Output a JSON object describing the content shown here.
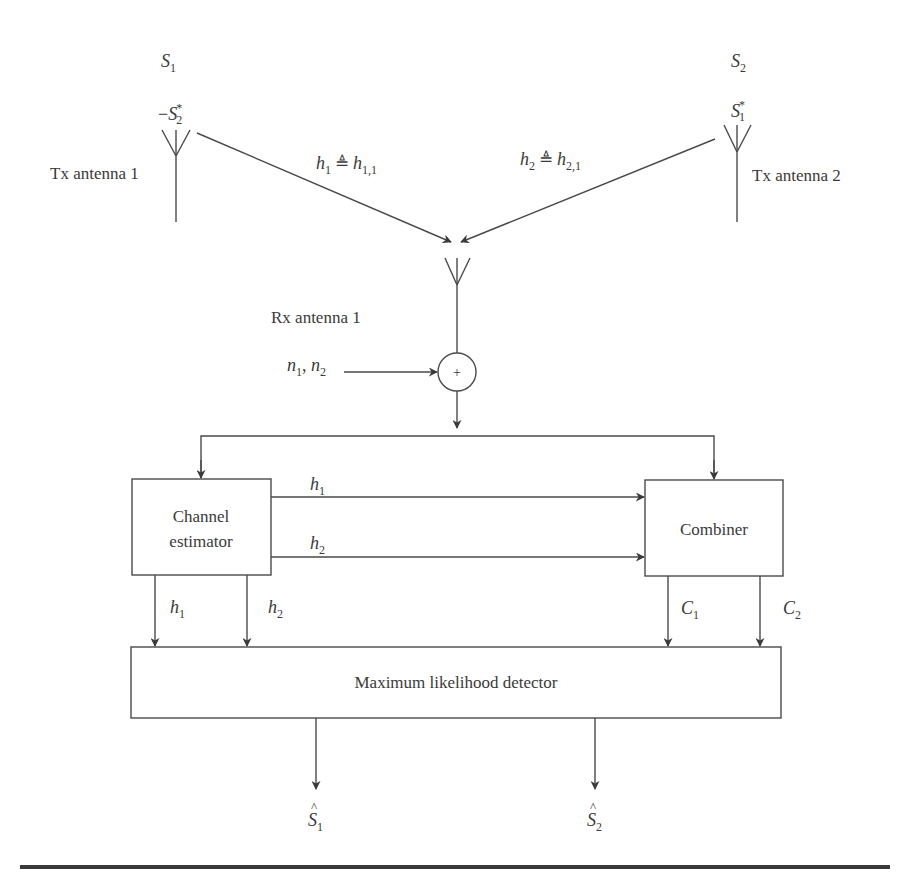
{
  "diagram": {
    "transmitters": [
      {
        "label": "Tx antenna 1",
        "symbol_t1": {
          "base": "S",
          "sub": "1",
          "sup": "",
          "prefix": ""
        },
        "symbol_t2": {
          "base": "S",
          "sub": "2",
          "sup": "*",
          "prefix": "−"
        }
      },
      {
        "label": "Tx antenna 2",
        "symbol_t1": {
          "base": "S",
          "sub": "2",
          "sup": "",
          "prefix": ""
        },
        "symbol_t2": {
          "base": "S",
          "sub": "1",
          "sup": "*",
          "prefix": ""
        }
      }
    ],
    "channels": [
      {
        "lhs": "h",
        "lhs_sub": "1",
        "op": "≜",
        "rhs": "h",
        "rhs_sub": "1,1"
      },
      {
        "lhs": "h",
        "lhs_sub": "2",
        "op": "≜",
        "rhs": "h",
        "rhs_sub": "2,1"
      }
    ],
    "receiver": {
      "label": "Rx antenna 1",
      "noise": {
        "a": "n",
        "a_sub": "1",
        "sep": ", ",
        "b": "n",
        "b_sub": "2"
      },
      "adder_symbol": "+"
    },
    "blocks": {
      "channel_estimator": {
        "line1": "Channel",
        "line2": "estimator"
      },
      "combiner": {
        "label": "Combiner"
      },
      "ml_detector": {
        "label": "Maximum likelihood detector"
      }
    },
    "signals": {
      "est_to_comb_1": {
        "base": "h",
        "sub": "1"
      },
      "est_to_comb_2": {
        "base": "h",
        "sub": "2"
      },
      "est_to_ml_1": {
        "base": "h",
        "sub": "1"
      },
      "est_to_ml_2": {
        "base": "h",
        "sub": "2"
      },
      "comb_to_ml_1": {
        "base": "C",
        "sub": "1"
      },
      "comb_to_ml_2": {
        "base": "C",
        "sub": "2"
      }
    },
    "outputs": [
      {
        "hat": "^",
        "base": "S",
        "sub": "1"
      },
      {
        "hat": "^",
        "base": "S",
        "sub": "2"
      }
    ],
    "colors": {
      "line": "#4a4a4a",
      "text": "#3a3a3a",
      "background": "#ffffff"
    }
  }
}
